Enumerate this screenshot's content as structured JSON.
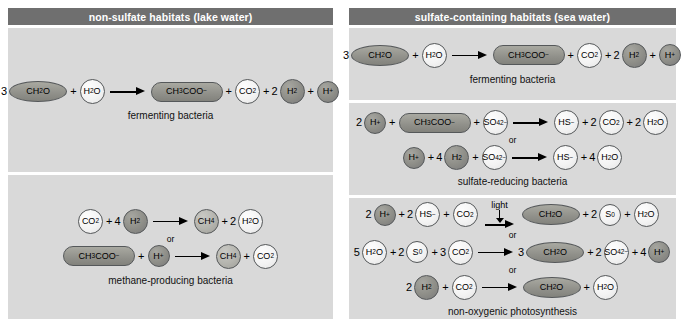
{
  "figure": {
    "columns": [
      {
        "id": "left",
        "header": "non-sulfate habitats (lake water)",
        "panels": [
          {
            "id": "fermenting-lake",
            "caption": "fermenting bacteria",
            "equations": [
              {
                "or_label": "",
                "terms": [
                  {
                    "coef": "3",
                    "label": "CH2O",
                    "shape": "oval",
                    "fill": "olive"
                  },
                  {
                    "op": "+"
                  },
                  {
                    "coef": "",
                    "label": "H2O",
                    "shape": "circle",
                    "fill": "white"
                  },
                  {
                    "arrow": true
                  },
                  {
                    "coef": "",
                    "label": "CH3COO-",
                    "shape": "pill",
                    "fill": "olive"
                  },
                  {
                    "op": "+"
                  },
                  {
                    "coef": "",
                    "label": "CO2",
                    "shape": "circle",
                    "fill": "white"
                  },
                  {
                    "op": "+"
                  },
                  {
                    "coef": "2",
                    "label": "H2",
                    "shape": "circle",
                    "fill": "dark"
                  },
                  {
                    "op": "+"
                  },
                  {
                    "coef": "",
                    "label": "H+",
                    "shape": "circle",
                    "fill": "dark"
                  }
                ]
              }
            ]
          },
          {
            "id": "methane-producing",
            "caption": "methane-producing bacteria",
            "equations": [
              {
                "or_label": "",
                "terms": [
                  {
                    "coef": "",
                    "label": "CO2",
                    "shape": "circle",
                    "fill": "white"
                  },
                  {
                    "op": "+"
                  },
                  {
                    "coef": "4",
                    "label": "H2",
                    "shape": "circle",
                    "fill": "dark"
                  },
                  {
                    "arrow": true
                  },
                  {
                    "coef": "",
                    "label": "CH4",
                    "shape": "circle",
                    "fill": "mid"
                  },
                  {
                    "op": "+"
                  },
                  {
                    "coef": "2",
                    "label": "H2O",
                    "shape": "circle",
                    "fill": "white"
                  }
                ]
              },
              {
                "or_label": "or",
                "terms": [
                  {
                    "coef": "",
                    "label": "CH3COO-",
                    "shape": "pill",
                    "fill": "olive"
                  },
                  {
                    "op": "+"
                  },
                  {
                    "coef": "",
                    "label": "H+",
                    "shape": "circle",
                    "fill": "dark"
                  },
                  {
                    "arrow": true
                  },
                  {
                    "coef": "",
                    "label": "CH4",
                    "shape": "circle",
                    "fill": "mid"
                  },
                  {
                    "op": "+"
                  },
                  {
                    "coef": "",
                    "label": "CO2",
                    "shape": "circle",
                    "fill": "white"
                  }
                ]
              }
            ]
          }
        ]
      },
      {
        "id": "right",
        "header": "sulfate-containing habitats (sea water)",
        "panels": [
          {
            "id": "fermenting-sea",
            "caption": "fermenting bacteria",
            "equations": [
              {
                "or_label": "",
                "terms": [
                  {
                    "coef": "3",
                    "label": "CH2O",
                    "shape": "oval",
                    "fill": "olive"
                  },
                  {
                    "op": "+"
                  },
                  {
                    "coef": "",
                    "label": "H2O",
                    "shape": "circle",
                    "fill": "white"
                  },
                  {
                    "arrow": true
                  },
                  {
                    "coef": "",
                    "label": "CH3COO-",
                    "shape": "pill",
                    "fill": "olive"
                  },
                  {
                    "op": "+"
                  },
                  {
                    "coef": "",
                    "label": "CO2",
                    "shape": "circle",
                    "fill": "white"
                  },
                  {
                    "op": "+"
                  },
                  {
                    "coef": "2",
                    "label": "H2",
                    "shape": "circle",
                    "fill": "dark"
                  },
                  {
                    "op": "+"
                  },
                  {
                    "coef": "",
                    "label": "H+",
                    "shape": "circle",
                    "fill": "dark"
                  }
                ]
              }
            ]
          },
          {
            "id": "sulfate-reducing",
            "caption": "sulfate-reducing bacteria",
            "equations": [
              {
                "or_label": "",
                "terms": [
                  {
                    "coef": "2",
                    "label": "H+",
                    "shape": "circle",
                    "fill": "dark"
                  },
                  {
                    "op": "+"
                  },
                  {
                    "coef": "",
                    "label": "CH3COO-",
                    "shape": "pill",
                    "fill": "olive"
                  },
                  {
                    "op": "+"
                  },
                  {
                    "coef": "",
                    "label": "SO42-",
                    "shape": "circle",
                    "fill": "white"
                  },
                  {
                    "arrow": true
                  },
                  {
                    "coef": "",
                    "label": "HS-",
                    "shape": "circle",
                    "fill": "white"
                  },
                  {
                    "op": "+"
                  },
                  {
                    "coef": "2",
                    "label": "CO2",
                    "shape": "circle",
                    "fill": "white"
                  },
                  {
                    "op": "+"
                  },
                  {
                    "coef": "2",
                    "label": "H2O",
                    "shape": "circle",
                    "fill": "white"
                  }
                ]
              },
              {
                "or_label": "or",
                "terms": [
                  {
                    "coef": "",
                    "label": "H+",
                    "shape": "circle",
                    "fill": "dark"
                  },
                  {
                    "op": "+"
                  },
                  {
                    "coef": "4",
                    "label": "H2",
                    "shape": "circle",
                    "fill": "dark"
                  },
                  {
                    "op": "+"
                  },
                  {
                    "coef": "",
                    "label": "SO42-",
                    "shape": "circle",
                    "fill": "white"
                  },
                  {
                    "arrow": true
                  },
                  {
                    "coef": "",
                    "label": "HS-",
                    "shape": "circle",
                    "fill": "white"
                  },
                  {
                    "op": "+"
                  },
                  {
                    "coef": "4",
                    "label": "H2O",
                    "shape": "circle",
                    "fill": "white"
                  }
                ]
              }
            ]
          },
          {
            "id": "non-oxygenic-photosynthesis",
            "caption": "non-oxygenic photosynthesis",
            "equations": [
              {
                "or_label": "",
                "light_label": "light",
                "terms": [
                  {
                    "coef": "2",
                    "label": "H+",
                    "shape": "circle",
                    "fill": "dark"
                  },
                  {
                    "op": "+"
                  },
                  {
                    "coef": "2",
                    "label": "HS-",
                    "shape": "circle",
                    "fill": "white"
                  },
                  {
                    "op": "+"
                  },
                  {
                    "coef": "",
                    "label": "CO2",
                    "shape": "circle",
                    "fill": "white"
                  },
                  {
                    "arrow": true,
                    "light": true
                  },
                  {
                    "coef": "",
                    "label": "CH2O",
                    "shape": "oval",
                    "fill": "olive"
                  },
                  {
                    "op": "+"
                  },
                  {
                    "coef": "2",
                    "label": "S0",
                    "shape": "circle",
                    "fill": "white"
                  },
                  {
                    "op": "+"
                  },
                  {
                    "coef": "",
                    "label": "H2O",
                    "shape": "circle",
                    "fill": "white"
                  }
                ]
              },
              {
                "or_label": "or",
                "terms": [
                  {
                    "coef": "5",
                    "label": "H2O",
                    "shape": "circle",
                    "fill": "white"
                  },
                  {
                    "op": "+"
                  },
                  {
                    "coef": "2",
                    "label": "S0",
                    "shape": "circle",
                    "fill": "white"
                  },
                  {
                    "op": "+"
                  },
                  {
                    "coef": "3",
                    "label": "CO2",
                    "shape": "circle",
                    "fill": "white"
                  },
                  {
                    "arrow": true
                  },
                  {
                    "coef": "3",
                    "label": "CH2O",
                    "shape": "oval",
                    "fill": "olive"
                  },
                  {
                    "op": "+"
                  },
                  {
                    "coef": "2",
                    "label": "SO42-",
                    "shape": "circle",
                    "fill": "white"
                  },
                  {
                    "op": "+"
                  },
                  {
                    "coef": "4",
                    "label": "H+",
                    "shape": "circle",
                    "fill": "dark"
                  }
                ]
              },
              {
                "or_label": "or",
                "terms": [
                  {
                    "coef": "2",
                    "label": "H2",
                    "shape": "circle",
                    "fill": "dark"
                  },
                  {
                    "op": "+"
                  },
                  {
                    "coef": "",
                    "label": "CO2",
                    "shape": "circle",
                    "fill": "white"
                  },
                  {
                    "arrow": true
                  },
                  {
                    "coef": "",
                    "label": "CH2O",
                    "shape": "oval",
                    "fill": "olive"
                  },
                  {
                    "op": "+"
                  },
                  {
                    "coef": "",
                    "label": "H2O",
                    "shape": "circle",
                    "fill": "white"
                  }
                ]
              }
            ]
          }
        ]
      }
    ],
    "colors": {
      "header_bg": "#6f6f6f",
      "header_text": "#ffffff",
      "panel_bg": "#d9d9d9",
      "page_bg": "#ffffff",
      "molecule_outline": "#55585a",
      "fill_white": "#f3f3f3",
      "fill_mid": "#b4b4ae",
      "fill_dark": "#8e8e88",
      "fill_olive": "#90908a"
    },
    "formula_glyphs": {
      "CH2O": "CH<sub>2</sub>O",
      "H2O": "H<sub>2</sub>O",
      "CH3COO-": "CH<sub>3</sub>COO<sup>−</sup>",
      "CO2": "CO<sub>2</sub>",
      "H2": "H<sub>2</sub>",
      "H+": "H<sup>+</sup>",
      "CH4": "CH<sub>4</sub>",
      "SO42-": "SO<sub>4</sub><sup>2−</sup>",
      "HS-": "HS<sup>−</sup>",
      "S0": "S<sup>0</sup>"
    }
  }
}
